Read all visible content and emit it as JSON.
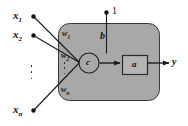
{
  "figure": {
    "colors": {
      "body_fill": "#a8a8a8",
      "body_stroke": "#3a3a3a",
      "square_fill": "#b4b4b4",
      "square_stroke": "#2a2a2a",
      "circle_fill": "#a8a8a8",
      "circle_stroke": "#1e1e1e",
      "line": "#1a1a1a",
      "dot": "#111111",
      "background": "#ffffff"
    }
  },
  "inputs": [
    {
      "id": "x1",
      "label": "x",
      "subscript": "1"
    },
    {
      "id": "x2",
      "label": "x",
      "subscript": "2"
    },
    {
      "id": "xn",
      "label": "x",
      "subscript": "n"
    }
  ],
  "weights": [
    {
      "id": "w1",
      "label": "w",
      "subscript": "1"
    },
    {
      "id": "w2",
      "label": "w",
      "subscript": "2"
    },
    {
      "id": "wn",
      "label": "w",
      "subscript": "n"
    }
  ],
  "bias": {
    "constant_label": "1",
    "weight_label": "b"
  },
  "nodes": {
    "summation_label": "c",
    "activation_label": "a"
  },
  "output": {
    "label": "y"
  },
  "ellipsis": {
    "glyph": "⋮"
  }
}
